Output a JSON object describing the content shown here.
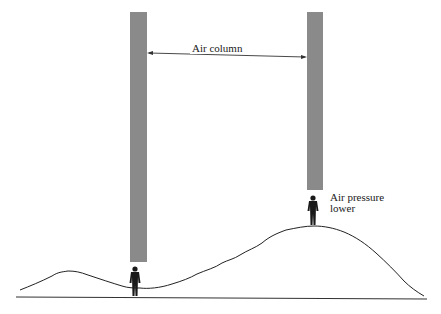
{
  "diagram": {
    "labels": {
      "air_column": "Air column",
      "air_pressure_line1": "Air pressure",
      "air_pressure_line2": "lower"
    },
    "elements": {
      "left_column": {
        "x": 130,
        "y": 12,
        "w": 17,
        "h": 250,
        "color": "#8a8a8a"
      },
      "right_column": {
        "x": 307,
        "y": 12,
        "w": 16,
        "h": 178,
        "color": "#8a8a8a"
      },
      "person_valley": {
        "x": 135,
        "y": 267
      },
      "person_peak": {
        "x": 313,
        "y": 197
      },
      "baseline_y": 297
    },
    "colors": {
      "column": "#8a8a8a",
      "line": "#222222",
      "figure": "#1a1a1a",
      "background": "#ffffff"
    }
  }
}
